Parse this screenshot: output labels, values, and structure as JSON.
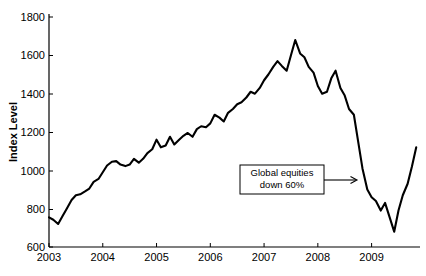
{
  "chart_data": {
    "type": "line",
    "title": "",
    "xlabel": "",
    "ylabel": "Index Level",
    "xlim": [
      2003.0,
      2009.9
    ],
    "ylim": [
      600,
      1800
    ],
    "grid": false,
    "legend": "none",
    "xticks": [
      "2003",
      "2004",
      "2005",
      "2006",
      "2007",
      "2008",
      "2009"
    ],
    "xtick_values": [
      2003,
      2004,
      2005,
      2006,
      2007,
      2008,
      2009
    ],
    "yticks": [
      "600",
      "800",
      "1000",
      "1200",
      "1400",
      "1600",
      "1800"
    ],
    "ytick_values": [
      600,
      800,
      1000,
      1200,
      1400,
      1600,
      1800
    ],
    "series": [
      {
        "name": "Global equity index",
        "x": [
          2003.0,
          2003.08,
          2003.17,
          2003.25,
          2003.33,
          2003.42,
          2003.5,
          2003.58,
          2003.67,
          2003.75,
          2003.83,
          2003.92,
          2004.0,
          2004.08,
          2004.17,
          2004.25,
          2004.33,
          2004.42,
          2004.5,
          2004.58,
          2004.67,
          2004.75,
          2004.83,
          2004.92,
          2005.0,
          2005.08,
          2005.17,
          2005.25,
          2005.33,
          2005.42,
          2005.5,
          2005.58,
          2005.67,
          2005.75,
          2005.83,
          2005.92,
          2006.0,
          2006.08,
          2006.17,
          2006.25,
          2006.33,
          2006.42,
          2006.5,
          2006.58,
          2006.67,
          2006.75,
          2006.83,
          2006.92,
          2007.0,
          2007.08,
          2007.17,
          2007.25,
          2007.33,
          2007.42,
          2007.5,
          2007.58,
          2007.67,
          2007.75,
          2007.83,
          2007.92,
          2008.0,
          2008.08,
          2008.17,
          2008.25,
          2008.33,
          2008.42,
          2008.5,
          2008.58,
          2008.67,
          2008.75,
          2008.83,
          2008.92,
          2009.0,
          2009.08,
          2009.17,
          2009.25,
          2009.33,
          2009.42,
          2009.5,
          2009.58,
          2009.67,
          2009.75,
          2009.83
        ],
        "y": [
          755,
          742,
          720,
          760,
          800,
          845,
          870,
          875,
          890,
          905,
          940,
          955,
          990,
          1025,
          1045,
          1048,
          1030,
          1022,
          1030,
          1060,
          1040,
          1060,
          1090,
          1110,
          1160,
          1120,
          1130,
          1175,
          1135,
          1160,
          1180,
          1195,
          1175,
          1215,
          1230,
          1225,
          1245,
          1290,
          1275,
          1255,
          1300,
          1320,
          1345,
          1355,
          1380,
          1410,
          1400,
          1430,
          1470,
          1500,
          1540,
          1570,
          1545,
          1520,
          1600,
          1680,
          1610,
          1590,
          1540,
          1510,
          1440,
          1400,
          1410,
          1480,
          1520,
          1430,
          1390,
          1320,
          1290,
          1150,
          1010,
          900,
          860,
          840,
          790,
          830,
          760,
          680,
          790,
          870,
          930,
          1020,
          1120
        ]
      }
    ],
    "annotations": [
      {
        "label_line1": "Global equities",
        "label_line2": "down 60%",
        "type": "boxed-arrow",
        "arrow_direction": "right",
        "points_to_x": 2008.82,
        "points_to_y": 900
      }
    ]
  }
}
